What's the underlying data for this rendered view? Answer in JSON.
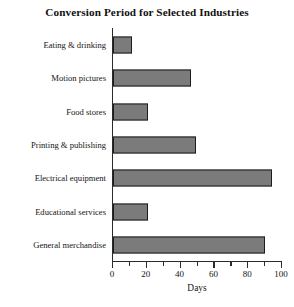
{
  "chart_data": {
    "type": "bar",
    "orientation": "horizontal",
    "title": "Conversion Period for Selected Industries",
    "xlabel": "Days",
    "ylabel": "",
    "xlim": [
      0,
      100
    ],
    "grid": false,
    "legend": null,
    "categories": [
      "Eating & drinking",
      "Motion pictures",
      "Food stores",
      "Printing & publishing",
      "Electrical equipment",
      "Educational services",
      "General merchandise"
    ],
    "values": [
      11,
      46,
      21,
      49,
      94,
      21,
      90
    ],
    "tick_labels": [
      "0",
      "20",
      "40",
      "60",
      "80",
      "100"
    ],
    "tick_values": [
      0,
      20,
      40,
      60,
      80,
      100
    ],
    "minor_tick_values": [
      10,
      30,
      50,
      70,
      90
    ],
    "bar_fill_color": "#7b7b7b",
    "bar_border_color": "#1c1c1c",
    "axis_color": "#2b2b2b",
    "background_color": "#ffffff"
  }
}
